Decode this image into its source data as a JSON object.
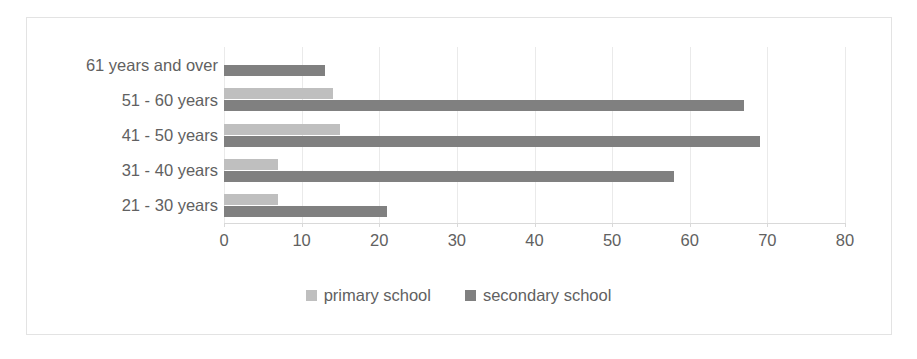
{
  "chart_data": {
    "type": "bar",
    "orientation": "horizontal",
    "title": "",
    "xlabel": "",
    "ylabel": "",
    "categories": [
      "21 - 30 years",
      "31 - 40 years",
      "41 - 50 years",
      "51 - 60 years",
      "61 years and over"
    ],
    "series": [
      {
        "name": "primary school",
        "color": "#bfbfbf",
        "values": [
          7,
          7,
          15,
          14,
          0
        ]
      },
      {
        "name": "secondary school",
        "color": "#808080",
        "values": [
          21,
          58,
          69,
          67,
          13
        ]
      }
    ],
    "xlim": [
      0,
      80
    ],
    "xticks": [
      0,
      10,
      20,
      30,
      40,
      50,
      60,
      70,
      80
    ],
    "xtick_labels": [
      "0",
      "10",
      "20",
      "30",
      "40",
      "50",
      "60",
      "70",
      "80"
    ],
    "grid": "vertical",
    "legend_position": "bottom"
  },
  "legend": {
    "items": [
      {
        "label": "primary school",
        "swatch": "primary"
      },
      {
        "label": "secondary school",
        "swatch": "secondary"
      }
    ]
  },
  "colors": {
    "primary": "#bfbfbf",
    "secondary": "#808080",
    "gridline": "#eaeaea",
    "axis": "#d9d9d9",
    "border": "#e3e3e3",
    "text": "#616161",
    "background": "#ffffff"
  }
}
